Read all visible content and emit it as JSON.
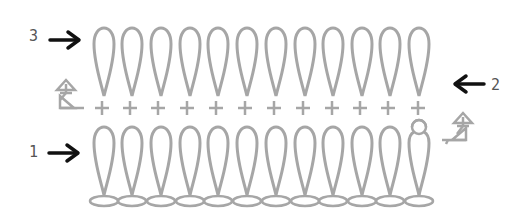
{
  "diagram": {
    "type": "crochet-stitch-chart",
    "stitch_color": "#a6a6a6",
    "arrow_color": "#111111",
    "label_color": "#555555",
    "columns": 12,
    "rows": [
      {
        "number": "1",
        "stitch": "treble/tall loop stitch",
        "direction": "right",
        "row_arrow": "right"
      },
      {
        "number": "2",
        "stitch": "single crochet (+)",
        "direction": "left",
        "row_arrow": "left"
      },
      {
        "number": "3",
        "stitch": "treble/tall loop stitch",
        "direction": "right",
        "row_arrow": "right"
      }
    ],
    "foundation": {
      "stitch": "chain",
      "count": 12
    },
    "labels": {
      "row1": "1",
      "row2": "2",
      "row3": "3"
    }
  }
}
